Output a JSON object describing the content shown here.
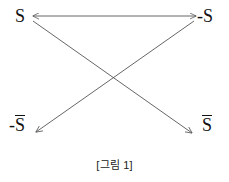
{
  "figure": {
    "caption": "[그림 1]",
    "background_color": "#ffffff",
    "stroke_color": "#555555",
    "text_color": "#111111",
    "nodes": [
      {
        "id": "s-topleft",
        "text": "S",
        "prefix": "",
        "overbar": false,
        "position": "top-left"
      },
      {
        "id": "neg-s-topright",
        "text": "-S",
        "prefix": "-",
        "base": "S",
        "overbar": false,
        "position": "top-right"
      },
      {
        "id": "neg-sbar-bottomleft",
        "text": "-S̄",
        "prefix": "-",
        "base": "S",
        "overbar": true,
        "position": "bottom-left"
      },
      {
        "id": "sbar-bottomright",
        "text": "S̄",
        "prefix": "",
        "base": "S",
        "overbar": true,
        "position": "bottom-right"
      }
    ],
    "edges": [
      {
        "id": "edge-top-horizontal",
        "from": "s-topleft",
        "to": "neg-s-topright",
        "arrowheads": "both"
      },
      {
        "id": "edge-diagonal-tl-br",
        "from": "s-topleft",
        "to": "sbar-bottomright",
        "arrowheads": "end"
      },
      {
        "id": "edge-diagonal-tr-bl",
        "from": "neg-s-topright",
        "to": "neg-sbar-bottomleft",
        "arrowheads": "end"
      }
    ]
  }
}
